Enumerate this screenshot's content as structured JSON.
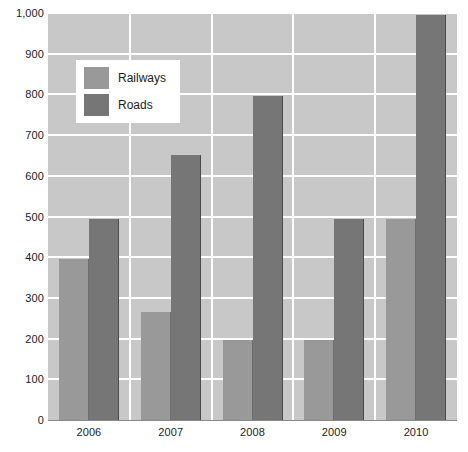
{
  "chart_data": {
    "type": "bar",
    "title": "",
    "xlabel": "",
    "ylabel": "",
    "categories": [
      "2006",
      "2007",
      "2008",
      "2009",
      "2010"
    ],
    "series": [
      {
        "name": "Railways",
        "color": "#999999",
        "values": [
          396,
          265,
          197,
          196,
          493
        ]
      },
      {
        "name": "Roads",
        "color": "#767676",
        "values": [
          495,
          650,
          795,
          493,
          995
        ]
      }
    ],
    "ylim": [
      0,
      1000
    ],
    "ytick_step": 100,
    "ytick_labels": [
      "0",
      "100",
      "200",
      "300",
      "400",
      "500",
      "600",
      "700",
      "800",
      "900",
      "1,000"
    ],
    "grid": true,
    "grid_color": "#ffffff",
    "plot_background": "#c8c8c8",
    "legend_position": "upper-left-inside"
  },
  "legend": {
    "entries": [
      {
        "label": "Railways"
      },
      {
        "label": "Roads"
      }
    ]
  }
}
